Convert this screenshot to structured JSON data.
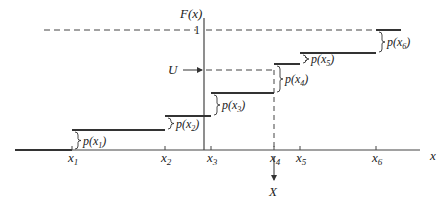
{
  "diagram": {
    "y_axis_label": "F(x)",
    "x_axis_label": "x",
    "one_label": "1",
    "u_label": "U",
    "result_label": "X",
    "x_ticks": [
      {
        "main": "x",
        "sub": "1"
      },
      {
        "main": "x",
        "sub": "2"
      },
      {
        "main": "x",
        "sub": "3"
      },
      {
        "main": "x",
        "sub": "4"
      },
      {
        "main": "x",
        "sub": "5"
      },
      {
        "main": "x",
        "sub": "6"
      }
    ],
    "jump_labels": [
      {
        "pre": "p(x",
        "sub": "1",
        "post": ")"
      },
      {
        "pre": "p(x",
        "sub": "2",
        "post": ")"
      },
      {
        "pre": "p(x",
        "sub": "3",
        "post": ")"
      },
      {
        "pre": "p(x",
        "sub": "4",
        "post": ")"
      },
      {
        "pre": "p(x",
        "sub": "5",
        "post": ")"
      },
      {
        "pre": "p(x",
        "sub": "6",
        "post": ")"
      }
    ],
    "cdf_levels": [
      0,
      0.1,
      0.17,
      0.29,
      0.45,
      0.51,
      0.64
    ],
    "u_value_note": "U falls in the jump at x4, so X = x4",
    "selected_index": 3,
    "colors": {
      "line": "#333333",
      "text": "#222222"
    }
  }
}
